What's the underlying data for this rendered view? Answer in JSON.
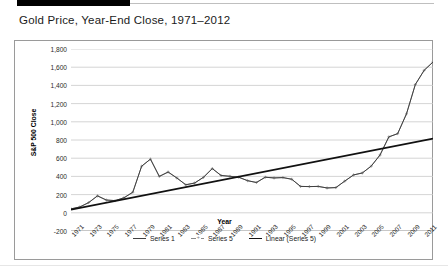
{
  "figure": {
    "title": "Gold Price, Year-End Close, 1971–2012"
  },
  "chart_data": {
    "type": "line",
    "title": "Gold Price, Year-End Close, 1971–2012",
    "xlabel": "Year",
    "ylabel": "S&P 500 Close",
    "ylim": [
      -200,
      1800
    ],
    "ytick_labels": [
      "1,800",
      "1,600",
      "1,400",
      "1,200",
      "1,000",
      "800",
      "600",
      "400",
      "200",
      "0",
      "-200"
    ],
    "ytick_values": [
      1800,
      1600,
      1400,
      1200,
      1000,
      800,
      600,
      400,
      200,
      0,
      -200
    ],
    "grid": true,
    "legend_position": "bottom",
    "legend": [
      "Series 1",
      "Series 5",
      "Linear (Series 5)"
    ],
    "x": [
      1971,
      1972,
      1973,
      1974,
      1975,
      1976,
      1977,
      1978,
      1979,
      1980,
      1981,
      1982,
      1983,
      1984,
      1985,
      1986,
      1987,
      1988,
      1989,
      1990,
      1991,
      1992,
      1993,
      1994,
      1995,
      1996,
      1997,
      1998,
      1999,
      2000,
      2001,
      2002,
      2003,
      2004,
      2005,
      2006,
      2007,
      2008,
      2009,
      2010,
      2011,
      2012
    ],
    "xtick_labels": [
      "1971",
      "1973",
      "1975",
      "1977",
      "1979",
      "1981",
      "1983",
      "1985",
      "1987",
      "1989",
      "1991",
      "1993",
      "1995",
      "1997",
      "1999",
      "2001",
      "2003",
      "2005",
      "2007",
      "2009",
      "2011"
    ],
    "series": [
      {
        "name": "Series 5",
        "marker": "cross",
        "color": "#8a8a8a",
        "values": [
          43,
          64,
          112,
          186,
          140,
          134,
          165,
          226,
          512,
          590,
          400,
          448,
          382,
          308,
          327,
          390,
          486,
          410,
          401,
          391,
          353,
          333,
          391,
          383,
          387,
          369,
          290,
          288,
          290,
          273,
          277,
          348,
          416,
          438,
          513,
          635,
          834,
          870,
          1088,
          1410,
          1566,
          1657
        ]
      },
      {
        "name": "Series 1",
        "marker": "none",
        "color": "#404040",
        "values": [
          43,
          64,
          112,
          186,
          140,
          134,
          165,
          226,
          512,
          590,
          400,
          448,
          382,
          308,
          327,
          390,
          486,
          410,
          401,
          391,
          353,
          333,
          391,
          383,
          387,
          369,
          290,
          288,
          290,
          273,
          277,
          348,
          416,
          438,
          513,
          635,
          834,
          870,
          1088,
          1410,
          1566,
          1657
        ]
      },
      {
        "name": "Linear (Series 5)",
        "marker": "none",
        "color": "#111111",
        "trend": true,
        "start_value": 35,
        "end_value": 815
      }
    ]
  },
  "axis": {
    "y_title": "S&P 500 Close",
    "x_title": "Year"
  }
}
